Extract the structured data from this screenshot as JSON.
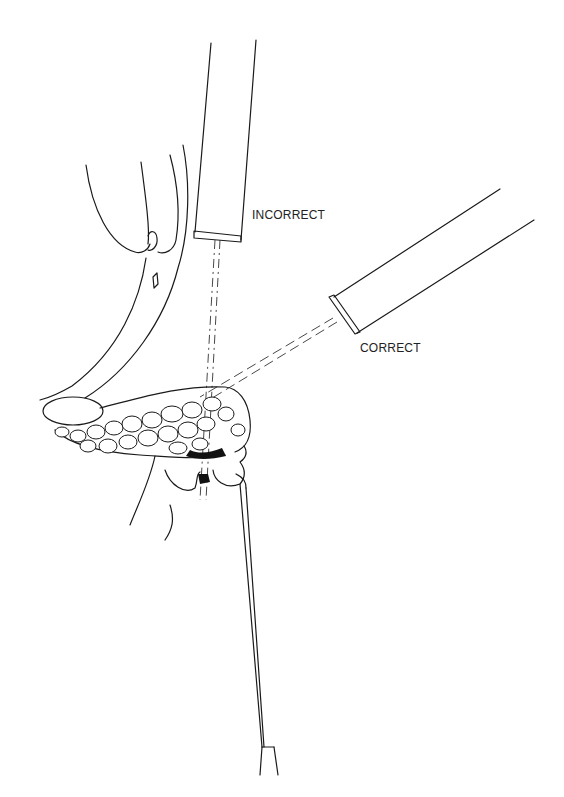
{
  "figure": {
    "type": "medical-line-drawing",
    "labels": {
      "incorrect": "INCORRECT",
      "correct": "CORRECT"
    },
    "elements": [
      "probe-incorrect",
      "probe-correct",
      "beam-incorrect",
      "beam-correct",
      "gallbladder-ducts",
      "pancreas-with-stones",
      "duodenum",
      "catheter"
    ],
    "colors": {
      "line": "#1a1a1a",
      "background": "#ffffff"
    }
  }
}
